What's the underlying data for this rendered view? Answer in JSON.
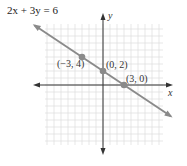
{
  "chart_data": {
    "type": "line",
    "title": "2x + 3y = 6",
    "xlabel": "x",
    "ylabel": "y",
    "xlim": [
      -8,
      8
    ],
    "ylim": [
      -8,
      9
    ],
    "grid": true,
    "legend": null,
    "series": [
      {
        "name": "2x + 3y = 6",
        "equation": "2x + 3y = 6",
        "color": "#8a8a8a",
        "x": [
          -10,
          10
        ],
        "y": [
          8.667,
          -4.667
        ]
      }
    ],
    "points": [
      {
        "x": -3,
        "y": 4,
        "label": "(−3, 4)"
      },
      {
        "x": 0,
        "y": 2,
        "label": "(0, 2)"
      },
      {
        "x": 3,
        "y": 0,
        "label": "(3, 0)"
      }
    ]
  },
  "labels": {
    "equation": "2x + 3y = 6",
    "x_axis": "x",
    "y_axis": "y",
    "p1": "(−3, 4)",
    "p2": "(0, 2)",
    "p3": "(3, 0)"
  },
  "colors": {
    "grid": "#dcdcdc",
    "axis": "#333333",
    "line": "#8a8a8a",
    "point": "#8a8a8a"
  }
}
